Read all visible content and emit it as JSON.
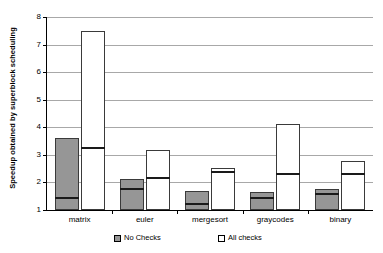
{
  "chart_data": {
    "type": "bar",
    "title": "",
    "subtitle": "",
    "xlabel": "",
    "ylabel": "Speedup obtained by superblock scheduling",
    "categories": [
      "matrix",
      "euler",
      "mergesort",
      "graycodes",
      "binary"
    ],
    "ylim": [
      1,
      8
    ],
    "yticks": [
      1,
      2,
      3,
      4,
      5,
      6,
      7,
      8
    ],
    "ytick_labels": [
      "1",
      "2",
      "3",
      "4",
      "5",
      "6",
      "7",
      "8"
    ],
    "grid": "horizontal",
    "legend_position": "bottom",
    "bar_style": "range-with-close-marker",
    "series": [
      {
        "name": "No Checks",
        "color": "#969696",
        "values": [
          3.6,
          2.12,
          1.7,
          1.65,
          1.75
        ],
        "baseline": [
          1.0,
          1.0,
          1.0,
          1.0,
          1.0
        ],
        "close_markers": [
          1.47,
          1.78,
          1.25,
          1.47,
          1.6
        ]
      },
      {
        "name": "All checks",
        "color": "#ffffff",
        "values": [
          7.5,
          3.16,
          2.53,
          4.11,
          2.76
        ],
        "baseline": [
          1.0,
          1.0,
          1.0,
          1.0,
          1.0
        ],
        "close_markers": [
          3.3,
          2.19,
          2.4,
          2.34,
          2.33
        ]
      }
    ],
    "legend": [
      {
        "label": "No Checks",
        "swatch": "gray"
      },
      {
        "label": "All checks",
        "swatch": "white"
      }
    ]
  },
  "colors": {
    "no_checks_fill": "#969696",
    "all_checks_fill": "#ffffff",
    "bar_border": "#3a3a3a",
    "gridline": "#a8a8a8",
    "axis": "#000000"
  }
}
